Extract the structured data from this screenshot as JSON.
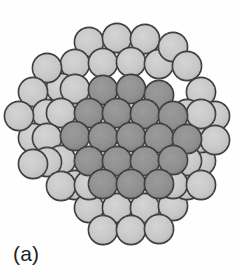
{
  "figure": {
    "label": "(a)",
    "type": "particle-packing-micrograph",
    "background_color": "#fefefe"
  },
  "style": {
    "light_fill": "#c9c9c9",
    "light_fill_edge": "#bdbdbd",
    "dark_fill": "#8b8b8b",
    "dark_fill_edge": "#808080",
    "outline_color": "#222222",
    "outline_width": 1.6,
    "disk_radius": 14.6,
    "lattice_spacing_x": 27.6,
    "lattice_spacing_y": 24.2,
    "label_color": "#1e1e1e"
  },
  "legend": {
    "light_label": "outer shell disk",
    "dark_label": "core disk"
  },
  "chart_data": {
    "type": "scatter",
    "title": "(a)",
    "xlabel": "",
    "ylabel": "",
    "xlim": [
      0,
      236
    ],
    "ylim": [
      0,
      248
    ],
    "grid": false,
    "legend_position": "none",
    "counts": {
      "total_disks": 61,
      "light_disks": 42,
      "dark_disks": 19
    },
    "series": [
      {
        "name": "core disk",
        "shade": "dark",
        "color": "#8b8b8b",
        "points": [
          [
            103,
            90
          ],
          [
            131,
            89
          ],
          [
            159,
            95
          ],
          [
            89,
            113
          ],
          [
            117,
            113
          ],
          [
            145,
            114
          ],
          [
            173,
            116
          ],
          [
            75,
            136
          ],
          [
            103,
            137
          ],
          [
            131,
            137
          ],
          [
            159,
            138
          ],
          [
            187,
            139
          ],
          [
            89,
            161
          ],
          [
            117,
            161
          ],
          [
            145,
            161
          ],
          [
            173,
            160
          ],
          [
            103,
            184
          ],
          [
            131,
            184
          ],
          [
            159,
            184
          ]
        ]
      },
      {
        "name": "outer shell disk",
        "shade": "light",
        "color": "#c9c9c9",
        "points": [
          [
            89,
            42
          ],
          [
            117,
            38
          ],
          [
            145,
            39
          ],
          [
            75,
            64
          ],
          [
            103,
            63
          ],
          [
            131,
            62
          ],
          [
            159,
            64
          ],
          [
            173,
            47
          ],
          [
            61,
            88
          ],
          [
            47,
            68
          ],
          [
            75,
            89
          ],
          [
            187,
            66
          ],
          [
            201,
            92
          ],
          [
            187,
            114
          ],
          [
            33,
            92
          ],
          [
            47,
            114
          ],
          [
            61,
            113
          ],
          [
            33,
            138
          ],
          [
            47,
            138
          ],
          [
            61,
            160
          ],
          [
            75,
            185
          ],
          [
            47,
            162
          ],
          [
            33,
            164
          ],
          [
            61,
            186
          ],
          [
            89,
            208
          ],
          [
            117,
            208
          ],
          [
            145,
            208
          ],
          [
            173,
            206
          ],
          [
            103,
            230
          ],
          [
            131,
            230
          ],
          [
            159,
            229
          ],
          [
            187,
            185
          ],
          [
            201,
            161
          ],
          [
            201,
            138
          ],
          [
            215,
            116
          ],
          [
            215,
            140
          ],
          [
            201,
            114
          ],
          [
            187,
            161
          ],
          [
            173,
            184
          ],
          [
            89,
            185
          ],
          [
            201,
            185
          ],
          [
            19,
            116
          ]
        ]
      }
    ]
  }
}
